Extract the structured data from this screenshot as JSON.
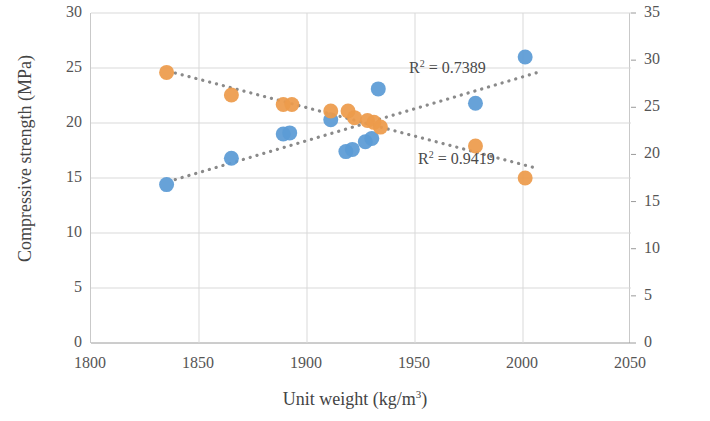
{
  "chart_data": {
    "type": "scatter",
    "title": "",
    "xlabel": "Unit weight (kg/m3)",
    "xlabel_parts": {
      "base": "Unit weight (kg/m",
      "sup": "3",
      "tail": ")"
    },
    "ylabel_left": "Compressive strength (MPa)",
    "ylabel_right": "Voids content (%)",
    "xlim": [
      1800,
      2050
    ],
    "xticks": [
      1800,
      1850,
      1900,
      1950,
      2000,
      2050
    ],
    "ylim_left": [
      0,
      30
    ],
    "yticks_left": [
      0,
      5,
      10,
      15,
      20,
      25,
      30
    ],
    "ylim_right": [
      0,
      35
    ],
    "yticks_right": [
      0,
      5,
      10,
      15,
      20,
      25,
      30,
      35
    ],
    "grid": true,
    "legend": "none",
    "series": [
      {
        "name": "Compressive strength",
        "axis": "left",
        "color": "#5b9bd5",
        "marker": "circle",
        "trendline": "dotted",
        "r2_label": "R² = 0.7389",
        "r2_value": 0.7389,
        "points": [
          {
            "x": 1835,
            "y": 14.4
          },
          {
            "x": 1865,
            "y": 16.8
          },
          {
            "x": 1889,
            "y": 19.0
          },
          {
            "x": 1892,
            "y": 19.1
          },
          {
            "x": 1911,
            "y": 20.3
          },
          {
            "x": 1918,
            "y": 17.4
          },
          {
            "x": 1921,
            "y": 17.6
          },
          {
            "x": 1927,
            "y": 18.3
          },
          {
            "x": 1930,
            "y": 18.6
          },
          {
            "x": 1933,
            "y": 23.1
          },
          {
            "x": 1978,
            "y": 21.8
          },
          {
            "x": 2001,
            "y": 26.0
          }
        ]
      },
      {
        "name": "Voids content",
        "axis": "right",
        "color": "#ed9b4b",
        "marker": "circle",
        "trendline": "dotted",
        "r2_label": "R² = 0.9419",
        "r2_value": 0.9419,
        "points": [
          {
            "x": 1835,
            "y": 28.7
          },
          {
            "x": 1865,
            "y": 26.3
          },
          {
            "x": 1889,
            "y": 25.3
          },
          {
            "x": 1893,
            "y": 25.3
          },
          {
            "x": 1911,
            "y": 24.6
          },
          {
            "x": 1919,
            "y": 24.6
          },
          {
            "x": 1922,
            "y": 23.9
          },
          {
            "x": 1928,
            "y": 23.6
          },
          {
            "x": 1931,
            "y": 23.4
          },
          {
            "x": 1934,
            "y": 22.9
          },
          {
            "x": 1978,
            "y": 20.9
          },
          {
            "x": 2001,
            "y": 17.5
          }
        ]
      }
    ]
  },
  "colors": {
    "blue": "#5b9bd5",
    "orange": "#ed9b4b",
    "grid": "#d9d9d9",
    "axis": "#bfbfbf",
    "text": "#444444"
  }
}
